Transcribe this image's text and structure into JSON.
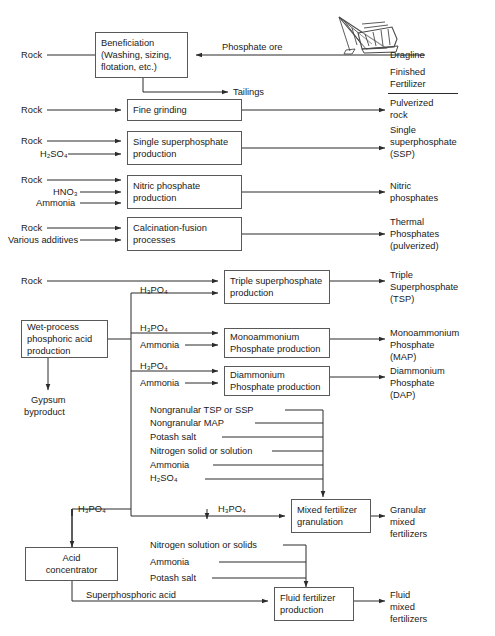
{
  "header": {
    "dragline_label": "Dragline",
    "finished_line1": "Finished",
    "finished_line2": "Fertilizer"
  },
  "processes": [
    {
      "id": "beneficiation",
      "lines": [
        "Beneficiation",
        "(Washing, sizing,",
        "flotation, etc.)"
      ]
    },
    {
      "id": "fine-grinding",
      "lines": [
        "Fine grinding"
      ]
    },
    {
      "id": "ssp",
      "lines": [
        "Single superphosphate",
        "production"
      ]
    },
    {
      "id": "nitric",
      "lines": [
        "Nitric phosphate",
        "production"
      ]
    },
    {
      "id": "calcination",
      "lines": [
        "Calcination-fusion",
        "processes"
      ]
    },
    {
      "id": "tsp",
      "lines": [
        "Triple superphosphate",
        "production"
      ]
    },
    {
      "id": "wet-process",
      "lines": [
        "Wet-process",
        "phosphoric acid",
        "production"
      ]
    },
    {
      "id": "map",
      "lines": [
        "Monoammonium",
        "Phosphate production"
      ]
    },
    {
      "id": "dap",
      "lines": [
        "Diammonium",
        "Phosphate production"
      ]
    },
    {
      "id": "granulation",
      "lines": [
        "Mixed fertilizer",
        "granulation"
      ]
    },
    {
      "id": "acid-conc",
      "lines": [
        "Acid",
        "concentrator"
      ]
    },
    {
      "id": "fluid",
      "lines": [
        "Fluid fertilizer",
        "production"
      ]
    }
  ],
  "inputs": {
    "rock": "Rock",
    "phosphate_ore": "Phosphate ore",
    "h2so4": "H₂SO₄",
    "hno3": "HNO₃",
    "ammonia": "Ammonia",
    "various_additives": "Various additives",
    "h3po4": "H₃PO₄",
    "nongranular_tsp_ssp": "Nongranular TSP or SSP",
    "nongranular_map": "Nongranular MAP",
    "potash_salt": "Potash salt",
    "nitrogen_solid_or_solution": "Nitrogen solid or solution",
    "nitrogen_solution_or_solids": "Nitrogen solution or solids",
    "superphosphoric_acid": "Superphosphoric acid"
  },
  "intermediates": {
    "tailings": "Tailings",
    "gypsum": [
      "Gypsum",
      "byproduct"
    ]
  },
  "outputs": [
    {
      "id": "pulverized-rock",
      "lines": [
        "Pulverized",
        "rock"
      ]
    },
    {
      "id": "ssp-out",
      "lines": [
        "Single",
        "superphosphate",
        "(SSP)"
      ]
    },
    {
      "id": "nitric-out",
      "lines": [
        "Nitric",
        "phosphates"
      ]
    },
    {
      "id": "thermal-out",
      "lines": [
        "Thermal",
        "Phosphates",
        "(pulverized)"
      ]
    },
    {
      "id": "tsp-out",
      "lines": [
        "Triple",
        "Superphosphate",
        "(TSP)"
      ]
    },
    {
      "id": "map-out",
      "lines": [
        "Monoammonium",
        "Phosphate",
        "(MAP)"
      ]
    },
    {
      "id": "dap-out",
      "lines": [
        "Diammonium",
        "Phosphate",
        "(DAP)"
      ]
    },
    {
      "id": "granular-out",
      "lines": [
        "Granular",
        "mixed",
        "fertilizers"
      ]
    },
    {
      "id": "fluid-out",
      "lines": [
        "Fluid",
        "mixed",
        "fertilizers"
      ]
    }
  ],
  "colors": {
    "line": "#2b2b2b",
    "box_border": "#595959",
    "text": "#1a1a1a",
    "background": "#ffffff"
  }
}
